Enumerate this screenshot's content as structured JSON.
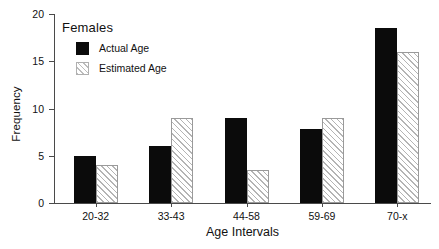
{
  "chart_data": {
    "type": "bar",
    "title": "",
    "xlabel": "Age Intervals",
    "ylabel": "Frequency",
    "categories": [
      "20-32",
      "33-43",
      "44-58",
      "59-69",
      "70-x"
    ],
    "series": [
      {
        "name": "Actual Age",
        "values": [
          5,
          6,
          9,
          7.8,
          18.5
        ],
        "color": "#0b0b0b",
        "fill": "solid"
      },
      {
        "name": "Estimated Age",
        "values": [
          4,
          9,
          3.5,
          9,
          16
        ],
        "color": "#b4b4b4",
        "fill": "diagonal-hatch"
      }
    ],
    "ylim": [
      0,
      20
    ],
    "yticks": [
      0,
      5,
      10,
      15,
      20
    ],
    "ytick_labels": [
      "0",
      "5",
      "10",
      "15",
      "20"
    ],
    "grid": false,
    "legend_position": "upper-left-inside",
    "legend_title": "Females"
  },
  "legend": {
    "title": "Females",
    "entries": [
      {
        "label": "Actual Age",
        "swatch": "solid-black-square"
      },
      {
        "label": "Estimated Age",
        "swatch": "hatched-square"
      }
    ]
  },
  "axes": {
    "y_title": "Frequency",
    "x_title": "Age Intervals"
  }
}
